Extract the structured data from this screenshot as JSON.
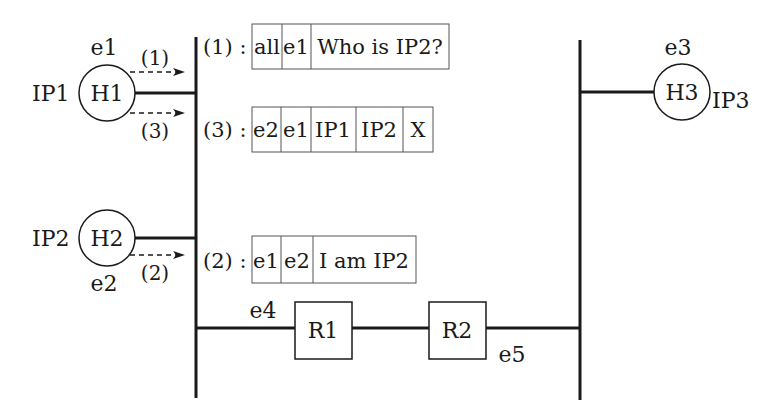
{
  "hosts": [
    {
      "id": "H1",
      "label": "H1",
      "mac": "e1",
      "ip": "IP1"
    },
    {
      "id": "H2",
      "label": "H2",
      "mac": "e2",
      "ip": "IP2"
    },
    {
      "id": "H3",
      "label": "H3",
      "mac": "e3",
      "ip": "IP3"
    }
  ],
  "routers": [
    {
      "id": "R1",
      "label": "R1",
      "mac": "e4"
    },
    {
      "id": "R2",
      "label": "R2",
      "mac": "e5"
    }
  ],
  "arrows": [
    {
      "label": "(1)"
    },
    {
      "label": "(3)"
    },
    {
      "label": "(2)"
    }
  ],
  "frames": [
    {
      "prefix": "(1) :",
      "fields": [
        "all",
        "e1",
        "Who is IP2?"
      ]
    },
    {
      "prefix": "(3) :",
      "fields": [
        "e2",
        "e1",
        "IP1",
        "IP2",
        "X"
      ]
    },
    {
      "prefix": "(2) :",
      "fields": [
        "e1",
        "e2",
        "I am IP2"
      ]
    }
  ],
  "colors": {
    "line": "#1a1a1a",
    "frame_border": "#555555"
  }
}
